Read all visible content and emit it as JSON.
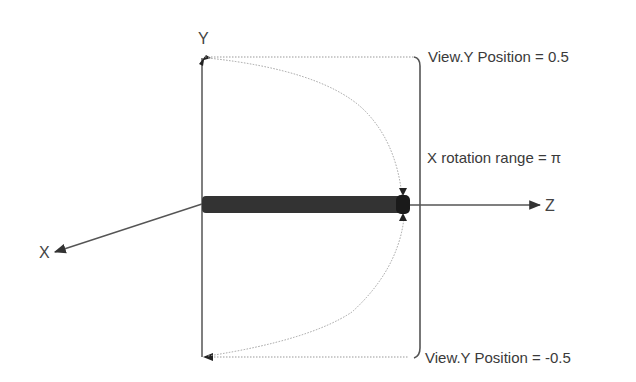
{
  "diagram": {
    "axes": {
      "x_label": "X",
      "y_label": "Y",
      "z_label": "Z"
    },
    "annotations": {
      "top": "View.Y Position = 0.5",
      "bottom": "View.Y Position = -0.5",
      "rotation": "X rotation range = π"
    },
    "colors": {
      "background": "#ffffff",
      "axis_line": "#555555",
      "dotted_line": "#9a9a9a",
      "bar_fill": "#333333",
      "text": "#3a3a3a"
    }
  }
}
